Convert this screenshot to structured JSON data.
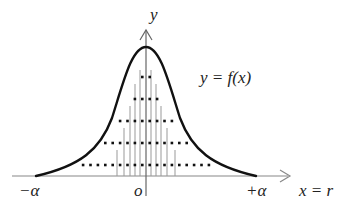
{
  "diagram": {
    "type": "bell-curve-histogram",
    "labels": {
      "y_axis": "y",
      "x_axis": "x = r",
      "curve": "y = f(x)",
      "origin": "o",
      "left_limit": "−α",
      "right_limit": "+α"
    },
    "colors": {
      "curve": "#111111",
      "axis": "#888888",
      "lines": "#999999",
      "dots": "#111111",
      "text": "#222222"
    },
    "dot_rows": [
      {
        "y": 77,
        "count": 2
      },
      {
        "y": 99,
        "count": 4
      },
      {
        "y": 121,
        "count": 8
      },
      {
        "y": 143,
        "count": 12
      },
      {
        "y": 165,
        "count": 18
      }
    ],
    "vertical_lines": [
      {
        "x": 117,
        "top": 150
      },
      {
        "x": 124,
        "top": 128
      },
      {
        "x": 130,
        "top": 106
      },
      {
        "x": 135,
        "top": 84
      },
      {
        "x": 140,
        "top": 70
      },
      {
        "x": 151,
        "top": 70
      },
      {
        "x": 156,
        "top": 84
      },
      {
        "x": 161,
        "top": 106
      },
      {
        "x": 167,
        "top": 128
      },
      {
        "x": 175,
        "top": 150
      }
    ]
  }
}
